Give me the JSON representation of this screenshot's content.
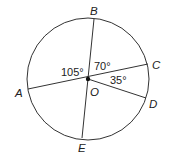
{
  "diagram": {
    "type": "circle-with-radii",
    "center": {
      "label": "O",
      "x": 88,
      "y": 79
    },
    "radius": 61,
    "points": [
      {
        "label": "A",
        "x": 28,
        "y": 89,
        "lx": 15,
        "ly": 97
      },
      {
        "label": "B",
        "x": 94,
        "y": 19,
        "lx": 91,
        "ly": 14
      },
      {
        "label": "C",
        "x": 148,
        "y": 64,
        "lx": 153,
        "ly": 68
      },
      {
        "label": "D",
        "x": 146,
        "y": 98,
        "lx": 150,
        "ly": 108
      },
      {
        "label": "E",
        "x": 82,
        "y": 138,
        "lx": 78,
        "ly": 152
      }
    ],
    "angles": [
      {
        "label": "105°",
        "x": 61,
        "y": 75
      },
      {
        "label": "70°",
        "x": 94,
        "y": 70
      },
      {
        "label": "35°",
        "x": 110,
        "y": 84
      }
    ],
    "colors": {
      "stroke": "#333333",
      "text": "#222222",
      "background": "#ffffff"
    }
  }
}
